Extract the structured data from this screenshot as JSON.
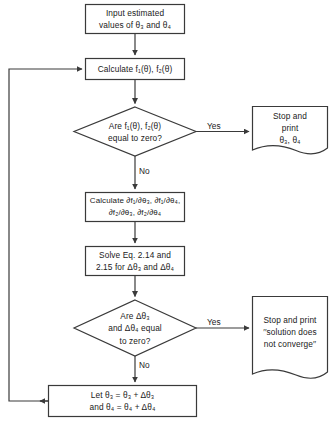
{
  "diagram": {
    "line_color": "#3a3a3a",
    "text_color": "#1a1a1a",
    "background": "#ffffff"
  },
  "nodes": {
    "input_values": {
      "shape": "process",
      "text": "Input estimated\nvalues of θ₃ and θ₄"
    },
    "calculate_f": {
      "shape": "process",
      "text": "Calculate f₁(θ), f₂(θ)"
    },
    "decision_f_zero": {
      "shape": "decision",
      "text": "Are f₁(θ), f₂(θ)\nequal to zero?"
    },
    "stop_print_theta": {
      "shape": "document",
      "text": "Stop and\nprint\nθ₃, θ₄"
    },
    "calculate_partials": {
      "shape": "process",
      "text": "Calculate ∂f₁/∂θ₃, ∂f₁/∂θ₄,\n∂f₂/∂θ₃, ∂f₂/∂θ₄"
    },
    "solve_equations": {
      "shape": "process",
      "text": "Solve Eq. 2.14 and\n2.15 for Δθ₃ and Δθ₄"
    },
    "decision_delta_zero": {
      "shape": "decision",
      "text": "Are Δθ₃\nand Δθ₄ equal\nto zero?"
    },
    "stop_print_diverge": {
      "shape": "document",
      "text": "Stop and print\n′′solution does\nnot converge′′"
    },
    "update_theta": {
      "shape": "process",
      "text": "Let θ₃  =  θ₃  +  Δθ₃\nand θ₄  =  θ₄  +  Δθ₄"
    }
  },
  "edge_labels": {
    "yes_top": "Yes",
    "no_top": "No",
    "yes_bottom": "Yes",
    "no_bottom": "No"
  }
}
